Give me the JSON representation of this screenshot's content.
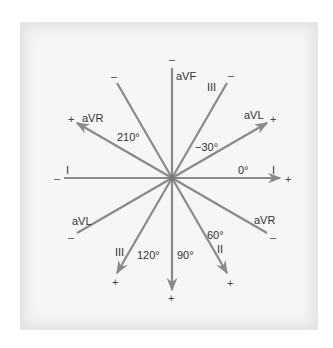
{
  "diagram": {
    "center": {
      "x": 172,
      "y": 178
    },
    "colors": {
      "line": "#8a8a8a",
      "text": "#333333",
      "panel": "#f6f6f6"
    },
    "leads": [
      {
        "name": "I",
        "angle": 0,
        "angle_label": "0°"
      },
      {
        "name": "II",
        "angle": 60,
        "angle_label": "60°"
      },
      {
        "name": "III",
        "angle": 120,
        "angle_label": "120°"
      },
      {
        "name": "aVF",
        "angle": 90,
        "angle_label": "90°"
      },
      {
        "name": "aVL",
        "angle": -30,
        "angle_label": "−30°"
      },
      {
        "name": "aVR",
        "angle": 210,
        "angle_label": "210°"
      }
    ],
    "labels": {
      "I_pos": "I",
      "I_neg": "I",
      "II_pos": "II",
      "III_pos": "III",
      "III_neg": "III",
      "aVF": "aVF",
      "aVL_pos": "aVL",
      "aVL_neg": "aVL",
      "aVR_pos": "aVR",
      "aVR_neg": "aVR",
      "deg_0": "0°",
      "deg_60": "60°",
      "deg_90": "90°",
      "deg_120": "120°",
      "deg_m30": "−30°",
      "deg_210": "210°",
      "plus": "+",
      "minus": "–"
    }
  }
}
